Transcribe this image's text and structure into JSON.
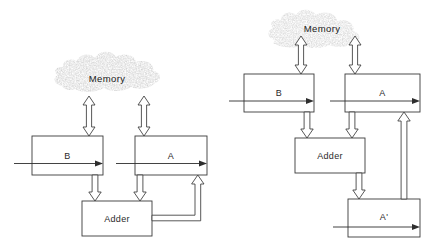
{
  "figure": {
    "kind": "block-diagram",
    "panel_count": 2,
    "stroke_color": "#3a3a3a",
    "fill_color": "#ffffff",
    "cloud_color": "#8a8a8a"
  },
  "left_panel": {
    "name": "single-accumulator-datapath",
    "memory": {
      "label": "Memory"
    },
    "boxes": [
      {
        "id": "b",
        "label": "B"
      },
      {
        "id": "a",
        "label": "A"
      },
      {
        "id": "adder",
        "label": "Adder"
      }
    ],
    "connections": [
      {
        "from": "Memory",
        "to": "B",
        "style": "double-headed"
      },
      {
        "from": "Memory",
        "to": "A",
        "style": "double-headed"
      },
      {
        "from": "B",
        "to": "Adder",
        "style": "hollow-down"
      },
      {
        "from": "A",
        "to": "Adder",
        "style": "hollow-down"
      },
      {
        "from": "Adder",
        "to": "A",
        "style": "feedback-up"
      }
    ]
  },
  "right_panel": {
    "name": "pipelined-accumulator-datapath",
    "memory": {
      "label": "Memory"
    },
    "boxes": [
      {
        "id": "b",
        "label": "B"
      },
      {
        "id": "a",
        "label": "A"
      },
      {
        "id": "adder",
        "label": "Adder"
      },
      {
        "id": "aprime",
        "label": "A'"
      }
    ],
    "connections": [
      {
        "from": "Memory",
        "to": "B",
        "style": "double-headed"
      },
      {
        "from": "Memory",
        "to": "A",
        "style": "double-headed"
      },
      {
        "from": "B",
        "to": "Adder",
        "style": "hollow-down"
      },
      {
        "from": "A",
        "to": "Adder",
        "style": "hollow-down"
      },
      {
        "from": "Adder",
        "to": "A'",
        "style": "hollow-down"
      },
      {
        "from": "A'",
        "to": "A",
        "style": "hollow-up"
      }
    ]
  }
}
